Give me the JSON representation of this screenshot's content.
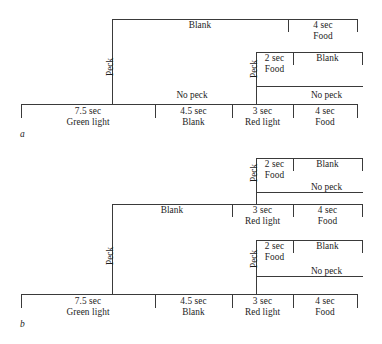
{
  "figure": {
    "type": "timeline-branching-diagram",
    "panels": [
      {
        "letter": "a",
        "rows": [
          {
            "row_name": "peck-outcome-row",
            "branch_label": "Peck",
            "segments": [
              {
                "line1": "Blank",
                "line2": ""
              },
              {
                "line1": "4 sec",
                "line2": "Food"
              }
            ]
          },
          {
            "row_name": "peck-red-light-row",
            "branch_label": "Peck",
            "segments": [
              {
                "line1": "2 sec",
                "line2": "Food"
              },
              {
                "line1": "Blank",
                "line2": ""
              }
            ]
          },
          {
            "row_name": "no-peck-upper-row",
            "branch_label": "No peck",
            "segments": []
          },
          {
            "row_name": "no-peck-red-light-row",
            "branch_label": "No peck",
            "segments": []
          },
          {
            "row_name": "baseline-row",
            "branch_label": "",
            "segments": [
              {
                "line1": "7.5 sec",
                "line2": "Green light"
              },
              {
                "line1": "4.5 sec",
                "line2": "Blank"
              },
              {
                "line1": "3 sec",
                "line2": "Red light"
              },
              {
                "line1": "4 sec",
                "line2": "Food"
              }
            ]
          }
        ]
      },
      {
        "letter": "b",
        "rows": [
          {
            "row_name": "peck-red-light-upper-row",
            "branch_label": "Peck",
            "segments": [
              {
                "line1": "2 sec",
                "line2": "Food"
              },
              {
                "line1": "Blank",
                "line2": ""
              }
            ]
          },
          {
            "row_name": "no-peck-upper-row",
            "branch_label": "No peck",
            "segments": []
          },
          {
            "row_name": "peck-outcome-row",
            "branch_label": "Peck",
            "segments": [
              {
                "line1": "Blank",
                "line2": ""
              },
              {
                "line1": "3 sec",
                "line2": "Red light"
              },
              {
                "line1": "4 sec",
                "line2": "Food"
              }
            ]
          },
          {
            "row_name": "peck-red-light-lower-row",
            "branch_label": "Peck",
            "segments": [
              {
                "line1": "2 sec",
                "line2": "Food"
              },
              {
                "line1": "Blank",
                "line2": ""
              }
            ]
          },
          {
            "row_name": "no-peck-lower-row",
            "branch_label": "No peck",
            "segments": []
          },
          {
            "row_name": "baseline-row",
            "branch_label": "",
            "segments": [
              {
                "line1": "7.5 sec",
                "line2": "Green light"
              },
              {
                "line1": "4.5 sec",
                "line2": "Blank"
              },
              {
                "line1": "3 sec",
                "line2": "Red light"
              },
              {
                "line1": "4 sec",
                "line2": "Food"
              }
            ]
          }
        ]
      }
    ]
  },
  "labels": {
    "blank": "Blank",
    "food_4": {
      "line1": "4 sec",
      "line2": "Food"
    },
    "food_2": {
      "line1": "2 sec",
      "line2": "Food"
    },
    "green_light": {
      "line1": "7.5 sec",
      "line2": "Green light"
    },
    "blank_45": {
      "line1": "4.5 sec",
      "line2": "Blank"
    },
    "red_light": {
      "line1": "3 sec",
      "line2": "Red light"
    },
    "peck": "Peck",
    "no_peck": "No peck",
    "panel_a": "a",
    "panel_b": "b"
  },
  "colors": {
    "line": "#3a3a3a",
    "text": "#1d1d1d",
    "background": "#ffffff"
  }
}
